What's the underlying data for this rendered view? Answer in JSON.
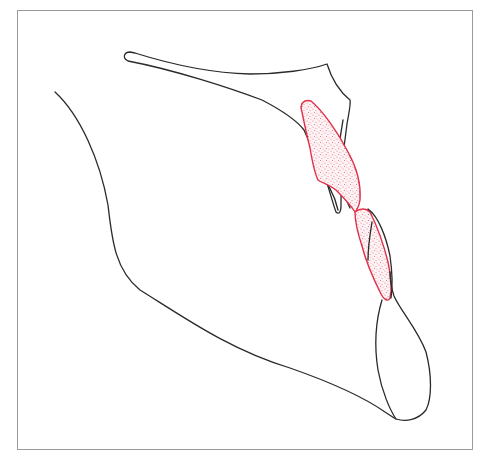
{
  "figure": {
    "title": "Cephalometric tracing",
    "colors": {
      "frame": "#9a9a9a",
      "bone_outline": "#2a2a2a",
      "tooth_outline": "#e0304a",
      "tooth_stipple": "#e8788a",
      "background": "#ffffff"
    },
    "elements": [
      {
        "name": "maxilla-outline",
        "type": "bone"
      },
      {
        "name": "ramus-mandible-outline",
        "type": "bone"
      },
      {
        "name": "lower-lip-chin-outline",
        "type": "bone"
      },
      {
        "name": "upper-incisor",
        "type": "tooth",
        "style": "red stippled"
      },
      {
        "name": "lower-incisor",
        "type": "tooth",
        "style": "red stippled"
      }
    ]
  }
}
